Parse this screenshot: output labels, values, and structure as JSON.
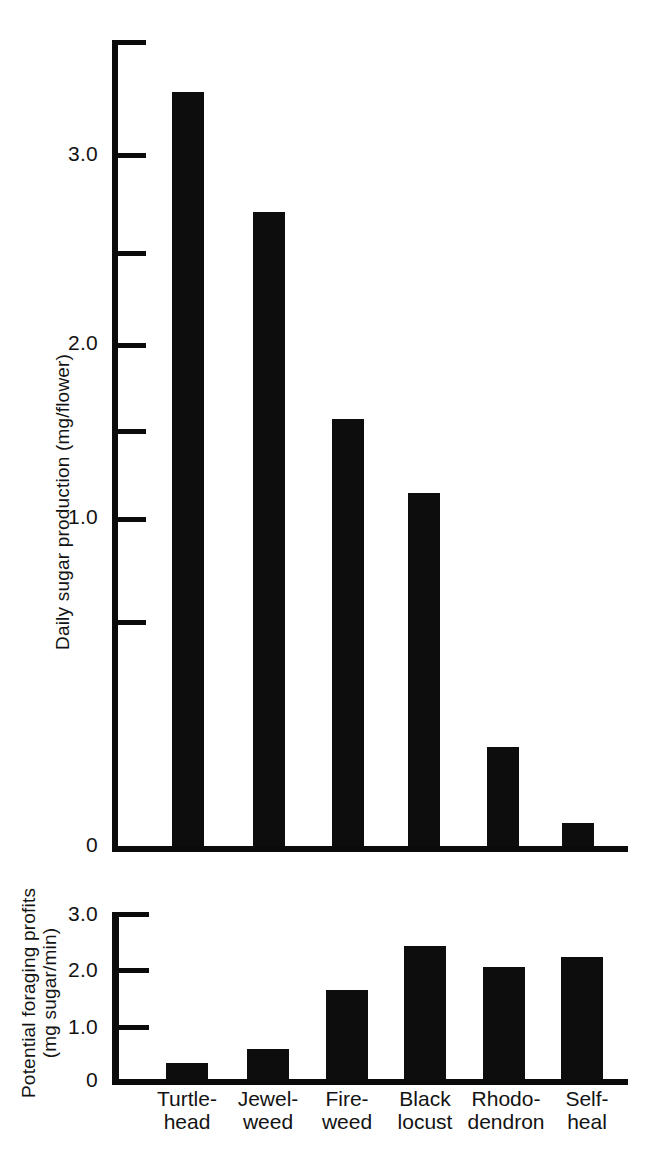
{
  "figure": {
    "background": "#ffffff",
    "ink_color": "#0d0d0d"
  },
  "chart_data": [
    {
      "type": "bar",
      "id": "daily-sugar-production",
      "title": "",
      "xlabel": "",
      "ylabel": "Daily sugar production (mg/flower)",
      "categories": [
        "Turtle-head",
        "Jewel-weed",
        "Fire-weed",
        "Black locust",
        "Rhododendron",
        "Self-heal"
      ],
      "values": [
        3.27,
        2.75,
        1.85,
        1.53,
        0.43,
        0.1
      ],
      "ylim": [
        0,
        3.5
      ],
      "yticks": [
        0,
        0.5,
        1.0,
        1.5,
        2.0,
        2.5,
        3.0,
        3.5
      ],
      "ytick_labels": [
        "0",
        "",
        "1.0",
        "",
        "2.0",
        "",
        "3.0",
        ""
      ],
      "grid": false,
      "legend": false
    },
    {
      "type": "bar",
      "id": "potential-foraging-profits",
      "title": "",
      "xlabel": "",
      "ylabel": "Potential foraging profits (mg sugar/min)",
      "ylabel_line1": "Potential foraging profits",
      "ylabel_line2": "(mg sugar/min)",
      "categories": [
        "Turtle-head",
        "Jewel-weed",
        "Fire-weed",
        "Black locust",
        "Rhododendron",
        "Self-heal"
      ],
      "values": [
        0.28,
        0.53,
        1.58,
        2.35,
        1.98,
        2.16
      ],
      "ylim": [
        0,
        3.0
      ],
      "yticks": [
        0,
        1.0,
        2.0,
        3.0
      ],
      "ytick_labels": [
        "0",
        "1.0",
        "2.0",
        "3.0"
      ],
      "grid": false,
      "legend": false
    }
  ],
  "top_chart": {
    "ylabel": "Daily sugar production (mg/flower)",
    "ticks": [
      {
        "value": "3.0",
        "label": "3.0"
      },
      {
        "value": "2.5",
        "label": ""
      },
      {
        "value": "2.0",
        "label": "2.0"
      },
      {
        "value": "1.5",
        "label": ""
      },
      {
        "value": "1.0",
        "label": "1.0"
      },
      {
        "value": "0.5",
        "label": ""
      },
      {
        "value": "0",
        "label": "0"
      }
    ]
  },
  "bottom_chart": {
    "ylabel_line1": "Potential foraging profits",
    "ylabel_line2": "(mg sugar/min)",
    "ticks": [
      {
        "value": "3.0",
        "label": "3.0"
      },
      {
        "value": "2.0",
        "label": "2.0"
      },
      {
        "value": "1.0",
        "label": "1.0"
      },
      {
        "value": "0",
        "label": "0"
      }
    ]
  },
  "categories": [
    {
      "line1": "Turtle-",
      "line2": "head"
    },
    {
      "line1": "Jewel-",
      "line2": "weed"
    },
    {
      "line1": "Fire-",
      "line2": "weed"
    },
    {
      "line1": "Black",
      "line2": "locust"
    },
    {
      "line1": "Rhodo-",
      "line2": "dendron"
    },
    {
      "line1": "Self-",
      "line2": "heal"
    }
  ]
}
